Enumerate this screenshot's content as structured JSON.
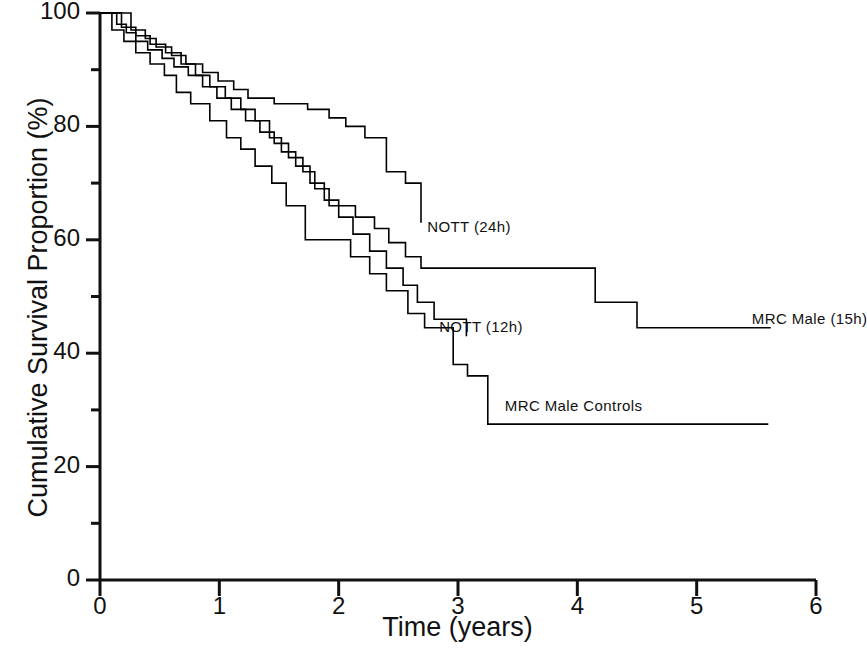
{
  "chart_data": {
    "type": "line",
    "subtype": "kaplan-meier-step",
    "title": "",
    "xlabel": "Time (years)",
    "ylabel": "Cumulative Survival Proportion (%)",
    "xlim": [
      0,
      6
    ],
    "ylim": [
      0,
      100
    ],
    "xticks": [
      0,
      1,
      2,
      3,
      4,
      5,
      6
    ],
    "xtick_labels": [
      "0",
      "1",
      "2",
      "3",
      "4",
      "5",
      "6"
    ],
    "yticks": [
      0,
      20,
      40,
      60,
      80,
      100
    ],
    "ytick_labels": [
      "0",
      "20",
      "40",
      "60",
      "80",
      "100"
    ],
    "y_minor_ticks": [
      10,
      30,
      50,
      70,
      90
    ],
    "grid": false,
    "legend": "inline-annotations",
    "line_color": "#000000",
    "line_width": 1.6,
    "series": [
      {
        "name": "NOTT (24h)",
        "label": "NOTT (24h)",
        "label_x": 2.7,
        "label_y": 62,
        "end_x": 2.69,
        "end_y": 63,
        "points": [
          [
            0.0,
            100
          ],
          [
            0.26,
            100
          ],
          [
            0.26,
            97
          ],
          [
            0.38,
            97
          ],
          [
            0.38,
            95.5
          ],
          [
            0.47,
            95.5
          ],
          [
            0.47,
            94
          ],
          [
            0.6,
            94
          ],
          [
            0.6,
            92.5
          ],
          [
            0.72,
            92.5
          ],
          [
            0.72,
            91
          ],
          [
            0.86,
            91
          ],
          [
            0.86,
            89.5
          ],
          [
            0.99,
            89.5
          ],
          [
            0.99,
            88
          ],
          [
            1.12,
            88
          ],
          [
            1.12,
            86.5
          ],
          [
            1.24,
            86.5
          ],
          [
            1.24,
            85
          ],
          [
            1.46,
            85
          ],
          [
            1.46,
            84
          ],
          [
            1.74,
            84
          ],
          [
            1.74,
            83
          ],
          [
            1.92,
            83
          ],
          [
            1.92,
            81.5
          ],
          [
            2.06,
            81.5
          ],
          [
            2.06,
            80
          ],
          [
            2.22,
            80
          ],
          [
            2.22,
            78
          ],
          [
            2.4,
            78
          ],
          [
            2.4,
            72
          ],
          [
            2.56,
            72
          ],
          [
            2.56,
            70
          ],
          [
            2.69,
            70
          ],
          [
            2.69,
            63
          ]
        ]
      },
      {
        "name": "MRC Male (15h)",
        "label": "MRC Male (15h)",
        "label_x": 5.42,
        "label_y": 45.8,
        "end_x": 5.62,
        "end_y": 44.5,
        "points": [
          [
            0.0,
            100
          ],
          [
            0.14,
            100
          ],
          [
            0.14,
            98
          ],
          [
            0.22,
            98
          ],
          [
            0.22,
            96.5
          ],
          [
            0.3,
            96.5
          ],
          [
            0.3,
            95
          ],
          [
            0.4,
            95
          ],
          [
            0.4,
            93.5
          ],
          [
            0.52,
            93.5
          ],
          [
            0.52,
            92
          ],
          [
            0.62,
            92
          ],
          [
            0.62,
            90.5
          ],
          [
            0.74,
            90.5
          ],
          [
            0.74,
            89
          ],
          [
            0.86,
            89
          ],
          [
            0.86,
            87
          ],
          [
            0.98,
            87
          ],
          [
            0.98,
            85
          ],
          [
            1.1,
            85
          ],
          [
            1.1,
            83
          ],
          [
            1.22,
            83
          ],
          [
            1.22,
            81
          ],
          [
            1.34,
            81
          ],
          [
            1.34,
            79
          ],
          [
            1.46,
            79
          ],
          [
            1.46,
            77
          ],
          [
            1.58,
            77
          ],
          [
            1.58,
            74.5
          ],
          [
            1.7,
            74.5
          ],
          [
            1.7,
            72
          ],
          [
            1.8,
            72
          ],
          [
            1.8,
            69
          ],
          [
            1.92,
            69
          ],
          [
            1.92,
            66
          ],
          [
            2.14,
            66
          ],
          [
            2.14,
            64
          ],
          [
            2.3,
            64
          ],
          [
            2.3,
            62
          ],
          [
            2.42,
            62
          ],
          [
            2.42,
            59.5
          ],
          [
            2.56,
            59.5
          ],
          [
            2.56,
            57
          ],
          [
            2.69,
            57
          ],
          [
            2.69,
            55
          ],
          [
            4.15,
            55
          ],
          [
            4.15,
            49
          ],
          [
            4.5,
            49
          ],
          [
            4.5,
            44.5
          ],
          [
            5.62,
            44.5
          ]
        ]
      },
      {
        "name": "NOTT (12h)",
        "label": "NOTT (12h)",
        "label_x": 2.8,
        "label_y": 44.5,
        "end_x": 3.07,
        "end_y": 43,
        "points": [
          [
            0.0,
            100
          ],
          [
            0.18,
            100
          ],
          [
            0.18,
            97.5
          ],
          [
            0.3,
            97.5
          ],
          [
            0.3,
            96
          ],
          [
            0.42,
            96
          ],
          [
            0.42,
            94.5
          ],
          [
            0.55,
            94.5
          ],
          [
            0.55,
            93
          ],
          [
            0.68,
            93
          ],
          [
            0.68,
            91
          ],
          [
            0.8,
            91
          ],
          [
            0.8,
            89
          ],
          [
            0.92,
            89
          ],
          [
            0.92,
            87
          ],
          [
            1.05,
            87
          ],
          [
            1.05,
            85
          ],
          [
            1.18,
            85
          ],
          [
            1.18,
            83
          ],
          [
            1.3,
            83
          ],
          [
            1.3,
            81
          ],
          [
            1.42,
            81
          ],
          [
            1.42,
            78
          ],
          [
            1.52,
            78
          ],
          [
            1.52,
            75.5
          ],
          [
            1.64,
            75.5
          ],
          [
            1.64,
            73
          ],
          [
            1.76,
            73
          ],
          [
            1.76,
            70
          ],
          [
            1.88,
            70
          ],
          [
            1.88,
            67
          ],
          [
            2.0,
            67
          ],
          [
            2.0,
            64
          ],
          [
            2.12,
            64
          ],
          [
            2.12,
            61
          ],
          [
            2.26,
            61
          ],
          [
            2.26,
            58
          ],
          [
            2.4,
            58
          ],
          [
            2.4,
            55
          ],
          [
            2.54,
            55
          ],
          [
            2.54,
            52
          ],
          [
            2.66,
            52
          ],
          [
            2.66,
            49
          ],
          [
            2.8,
            49
          ],
          [
            2.8,
            46
          ],
          [
            3.07,
            46
          ],
          [
            3.07,
            43
          ]
        ]
      },
      {
        "name": "MRC Male Controls",
        "label": "MRC Male Controls",
        "label_x": 3.35,
        "label_y": 30.5,
        "end_x": 5.6,
        "end_y": 27.5,
        "points": [
          [
            0.0,
            100
          ],
          [
            0.1,
            100
          ],
          [
            0.1,
            97
          ],
          [
            0.2,
            97
          ],
          [
            0.2,
            95
          ],
          [
            0.3,
            95
          ],
          [
            0.3,
            93
          ],
          [
            0.42,
            93
          ],
          [
            0.42,
            91
          ],
          [
            0.54,
            91
          ],
          [
            0.54,
            89
          ],
          [
            0.64,
            89
          ],
          [
            0.64,
            86
          ],
          [
            0.76,
            86
          ],
          [
            0.76,
            84
          ],
          [
            0.92,
            84
          ],
          [
            0.92,
            81
          ],
          [
            1.06,
            81
          ],
          [
            1.06,
            78
          ],
          [
            1.18,
            78
          ],
          [
            1.18,
            76
          ],
          [
            1.3,
            76
          ],
          [
            1.3,
            73
          ],
          [
            1.44,
            73
          ],
          [
            1.44,
            70
          ],
          [
            1.56,
            70
          ],
          [
            1.56,
            66
          ],
          [
            1.72,
            66
          ],
          [
            1.72,
            60
          ],
          [
            2.1,
            60
          ],
          [
            2.1,
            57
          ],
          [
            2.26,
            57
          ],
          [
            2.26,
            54
          ],
          [
            2.4,
            54
          ],
          [
            2.4,
            51
          ],
          [
            2.58,
            51
          ],
          [
            2.58,
            47
          ],
          [
            2.72,
            47
          ],
          [
            2.72,
            44.5
          ],
          [
            2.96,
            44.5
          ],
          [
            2.96,
            38
          ],
          [
            3.08,
            38
          ],
          [
            3.08,
            36
          ],
          [
            3.25,
            36
          ],
          [
            3.25,
            27.5
          ],
          [
            5.6,
            27.5
          ]
        ]
      }
    ]
  },
  "axes": {
    "x_title": "Time (years)",
    "y_title": "Cumulative Survival Proportion (%)"
  }
}
